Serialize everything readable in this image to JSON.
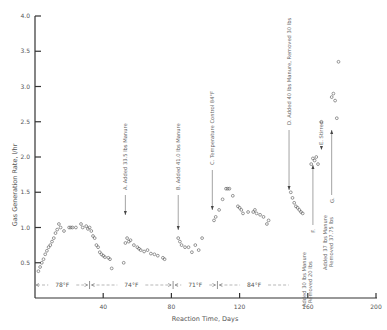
{
  "chart_data": {
    "type": "scatter",
    "title": "",
    "xlabel": "Reaction Time, Days",
    "ylabel": "Gas Generation Rate, l/hr",
    "xlim": [
      0,
      200
    ],
    "ylim": [
      0,
      4.0
    ],
    "x_ticks": [
      40,
      80,
      120,
      160,
      200
    ],
    "x_tick_labels": [
      "40",
      "80",
      "120",
      "160",
      "200"
    ],
    "y_ticks": [
      0.5,
      1.0,
      1.5,
      2.0,
      2.5,
      3.0,
      3.5,
      4.0
    ],
    "y_tick_labels": [
      "0.5",
      "1.0",
      "1.5",
      "2.0",
      "2.5",
      "3.0",
      "3.5",
      "4.0"
    ],
    "grid": false,
    "legend": null,
    "series": [
      {
        "name": "Gas Generation Rate",
        "marker": "open-circle",
        "points": [
          [
            2,
            0.38
          ],
          [
            3,
            0.44
          ],
          [
            4,
            0.5
          ],
          [
            5,
            0.55
          ],
          [
            6,
            0.62
          ],
          [
            7,
            0.67
          ],
          [
            8,
            0.72
          ],
          [
            9,
            0.75
          ],
          [
            10,
            0.8
          ],
          [
            11,
            0.85
          ],
          [
            12,
            0.92
          ],
          [
            13,
            0.97
          ],
          [
            14,
            1.05
          ],
          [
            15,
            1.0
          ],
          [
            17,
            0.95
          ],
          [
            20,
            1.0
          ],
          [
            21,
            1.0
          ],
          [
            22,
            1.0
          ],
          [
            24,
            1.0
          ],
          [
            27,
            1.05
          ],
          [
            28,
            1.0
          ],
          [
            30,
            1.02
          ],
          [
            31,
            0.98
          ],
          [
            32,
            1.0
          ],
          [
            33,
            0.95
          ],
          [
            34,
            0.88
          ],
          [
            35,
            0.85
          ],
          [
            36,
            0.75
          ],
          [
            37,
            0.72
          ],
          [
            38,
            0.65
          ],
          [
            39,
            0.62
          ],
          [
            40,
            0.6
          ],
          [
            41,
            0.58
          ],
          [
            43,
            0.57
          ],
          [
            44,
            0.55
          ],
          [
            45,
            0.42
          ],
          [
            52,
            0.5
          ],
          [
            53,
            0.78
          ],
          [
            54,
            0.85
          ],
          [
            55,
            0.8
          ],
          [
            56,
            0.82
          ],
          [
            58,
            0.75
          ],
          [
            60,
            0.72
          ],
          [
            61,
            0.7
          ],
          [
            62,
            0.68
          ],
          [
            64,
            0.66
          ],
          [
            66,
            0.68
          ],
          [
            68,
            0.63
          ],
          [
            70,
            0.62
          ],
          [
            72,
            0.6
          ],
          [
            75,
            0.57
          ],
          [
            76,
            0.55
          ],
          [
            84,
            0.85
          ],
          [
            85,
            0.8
          ],
          [
            86,
            0.75
          ],
          [
            88,
            0.72
          ],
          [
            90,
            0.72
          ],
          [
            92,
            0.65
          ],
          [
            94,
            0.75
          ],
          [
            96,
            0.68
          ],
          [
            98,
            0.85
          ],
          [
            105,
            1.1
          ],
          [
            106,
            1.15
          ],
          [
            108,
            1.25
          ],
          [
            110,
            1.4
          ],
          [
            112,
            1.55
          ],
          [
            113,
            1.55
          ],
          [
            114,
            1.55
          ],
          [
            116,
            1.45
          ],
          [
            119,
            1.3
          ],
          [
            120,
            1.28
          ],
          [
            121,
            1.25
          ],
          [
            122,
            1.2
          ],
          [
            125,
            1.22
          ],
          [
            128,
            1.22
          ],
          [
            129,
            1.25
          ],
          [
            130,
            1.2
          ],
          [
            132,
            1.18
          ],
          [
            134,
            1.15
          ],
          [
            136,
            1.05
          ],
          [
            137,
            1.1
          ],
          [
            150,
            1.5
          ],
          [
            151,
            1.42
          ],
          [
            152,
            1.35
          ],
          [
            153,
            1.3
          ],
          [
            154,
            1.28
          ],
          [
            155,
            1.25
          ],
          [
            156,
            1.22
          ],
          [
            157,
            1.2
          ],
          [
            162,
            1.9
          ],
          [
            163,
            1.98
          ],
          [
            164,
            1.95
          ],
          [
            165,
            2.0
          ],
          [
            166,
            1.9
          ],
          [
            168,
            2.5
          ],
          [
            174,
            2.85
          ],
          [
            175,
            2.9
          ],
          [
            176,
            2.8
          ],
          [
            178,
            3.35
          ],
          [
            177,
            2.55
          ]
        ]
      }
    ],
    "annotations": [
      {
        "label": "A",
        "text": "Added 33.5 lbs Manure",
        "day": 53
      },
      {
        "label": "B",
        "text": "Added 41.0 lbs Manure",
        "day": 84
      },
      {
        "label": "C",
        "text": "Temperature Control 84°F",
        "day": 104
      },
      {
        "label": "D",
        "text": "Added 40 lbs Manure, Removed 30 lbs",
        "day": 150
      },
      {
        "label": "E",
        "text": "Stirred",
        "day": 168
      },
      {
        "label": "F",
        "text": "Added 30 lbs Manure Removed 20 lbs",
        "day": 162
      },
      {
        "label": "G",
        "text": "Added 37 lbs Manure Removed 37.75 lbs",
        "day": 174
      }
    ],
    "temperature_ranges": [
      {
        "label": "78°F",
        "start": 0,
        "end": 32
      },
      {
        "label": "74°F",
        "start": 32,
        "end": 81
      },
      {
        "label": "71°F",
        "start": 81,
        "end": 107
      },
      {
        "label": "84°F",
        "start": 107,
        "end": 150
      }
    ]
  },
  "axes": {
    "xlabel": "Reaction Time, Days",
    "ylabel": "Gas Generation Rate, l/hr"
  }
}
